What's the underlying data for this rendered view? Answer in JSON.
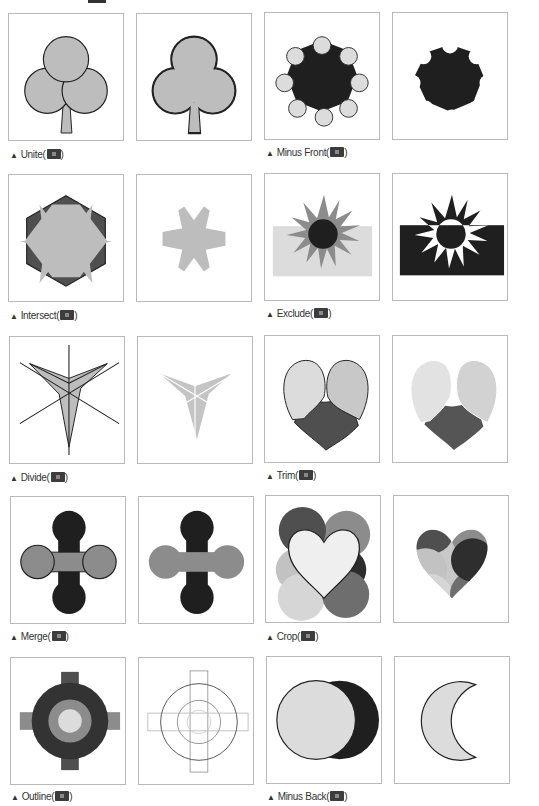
{
  "colors": {
    "black": "#1f1f1f",
    "dark_gray": "#4f4f4f",
    "mid_gray": "#8c8c8c",
    "light_gray": "#bdbdbd",
    "pale_gray": "#dcdcdc",
    "border": "#b9b9b9",
    "stroke": "#222222"
  },
  "operations": [
    {
      "id": "unite",
      "label": "Unite(",
      "suffix": ")",
      "icon": "unite-icon"
    },
    {
      "id": "minus-front",
      "label": "Minus Front(",
      "suffix": ")",
      "icon": "minus-front-icon"
    },
    {
      "id": "intersect",
      "label": "Intersect(",
      "suffix": ")",
      "icon": "intersect-icon"
    },
    {
      "id": "exclude",
      "label": "Exclude(",
      "suffix": ")",
      "icon": "exclude-icon"
    },
    {
      "id": "divide",
      "label": "Divide(",
      "suffix": ")",
      "icon": "divide-icon"
    },
    {
      "id": "trim",
      "label": "Trim(",
      "suffix": ")",
      "icon": "trim-icon"
    },
    {
      "id": "merge",
      "label": "Merge(",
      "suffix": ")",
      "icon": "merge-icon"
    },
    {
      "id": "crop",
      "label": "Crop(",
      "suffix": ")",
      "icon": "crop-icon"
    },
    {
      "id": "outline",
      "label": "Outline(",
      "suffix": ")",
      "icon": "outline-icon"
    },
    {
      "id": "minus-back",
      "label": "Minus Back(",
      "suffix": ")",
      "icon": "minus-back-icon"
    }
  ],
  "caption_marker": "▲"
}
